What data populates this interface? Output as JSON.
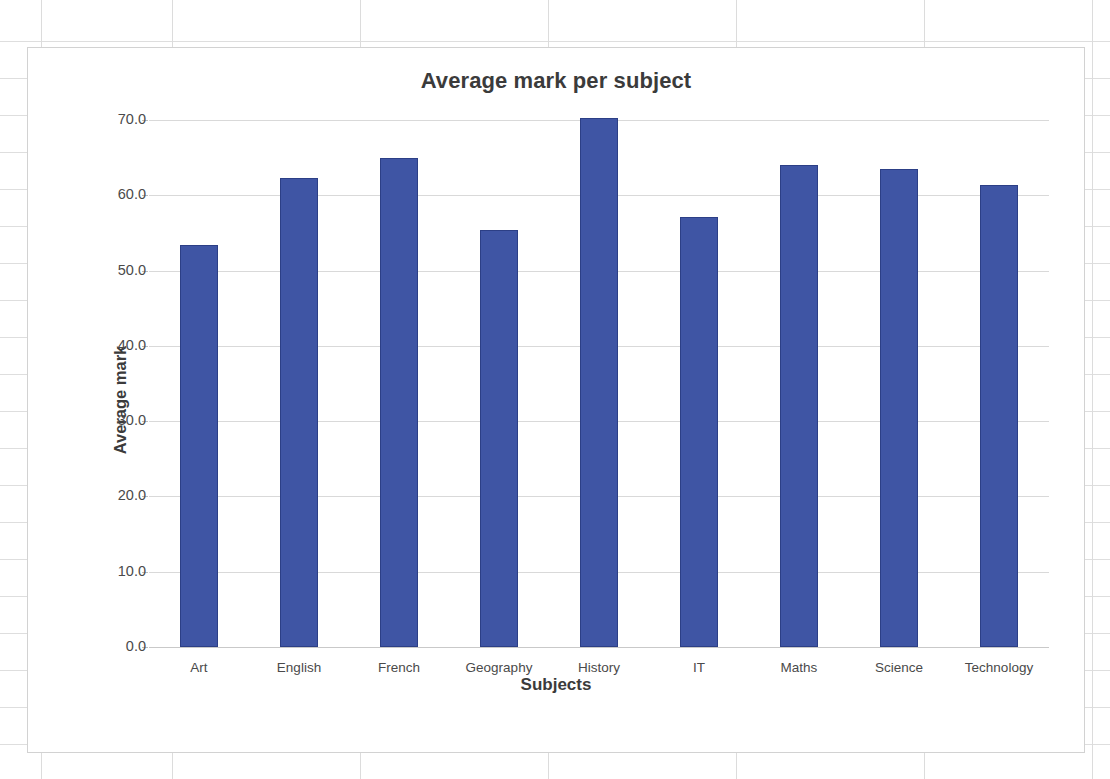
{
  "chart_data": {
    "type": "bar",
    "title": "Average mark per subject",
    "xlabel": "Subjects",
    "ylabel": "Average mark",
    "categories": [
      "Art",
      "English",
      "French",
      "Geography",
      "History",
      "IT",
      "Maths",
      "Science",
      "Technology"
    ],
    "values": [
      53.4,
      62.3,
      65.0,
      55.4,
      70.3,
      57.1,
      64.0,
      63.5,
      61.3
    ],
    "ylim": [
      0,
      70
    ],
    "ytick_step": 10,
    "ytick_labels": [
      "70.0",
      "60.0",
      "50.0",
      "40.0",
      "30.0",
      "20.0",
      "10.0",
      "0.0"
    ],
    "ytick_values": [
      70,
      60,
      50,
      40,
      30,
      20,
      10,
      0
    ],
    "grid": true,
    "legend": false,
    "series_color": "#3f55a4",
    "series_border_color": "#2c3f86",
    "gridline_color": "#d9d9d9",
    "plot_background": "#ffffff"
  },
  "frame": {
    "border_color": "#d2d2d2",
    "sheet_gridline_color": "#dedede"
  },
  "sheet": {
    "hlines": [
      41,
      78,
      115,
      152,
      189,
      226,
      263,
      300,
      337,
      374,
      411,
      448,
      485,
      522,
      559,
      596,
      633,
      670,
      707,
      744
    ],
    "vlines": [
      41,
      172,
      360,
      548,
      736,
      924,
      1092
    ]
  }
}
